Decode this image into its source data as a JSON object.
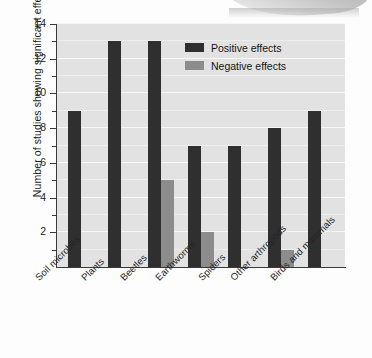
{
  "chart_data": {
    "type": "bar",
    "title": "",
    "xlabel": "",
    "ylabel": "Number of studies showing significant effects",
    "ylim": [
      0,
      14
    ],
    "ytick_step": 2,
    "yticks": [
      0,
      2,
      4,
      6,
      8,
      10,
      12,
      14
    ],
    "ytick_labels": [
      "",
      "2",
      "4",
      "6",
      "8",
      "10",
      "12",
      "14"
    ],
    "minor_ticks": [
      1,
      3,
      5,
      7,
      9,
      11,
      13
    ],
    "grid": true,
    "grid_orientation": "horizontal",
    "legend_position": "upper-center-right",
    "categories": [
      "Soil microbes",
      "Plants",
      "Beetles",
      "Earthworms",
      "Spiders",
      "Other arthropods",
      "Birds and mammals"
    ],
    "series": [
      {
        "name": "Positive effects",
        "color": "#2f2f2f",
        "values": [
          9,
          13,
          13,
          7,
          7,
          8,
          9
        ]
      },
      {
        "name": "Negative effects",
        "color": "#8c8c8c",
        "values": [
          0,
          0,
          5,
          2,
          0,
          1,
          0
        ]
      }
    ]
  },
  "legend": {
    "items": [
      {
        "label": "Positive effects",
        "color": "#2f2f2f"
      },
      {
        "label": "Negative effects",
        "color": "#8c8c8c"
      }
    ]
  },
  "colors": {
    "plot_background": "#e2e2e2",
    "gridline": "#f7f7f7",
    "axis": "#3a3a3a",
    "page_background": "#fdfdfd",
    "positive": "#2f2f2f",
    "negative": "#8c8c8c"
  }
}
